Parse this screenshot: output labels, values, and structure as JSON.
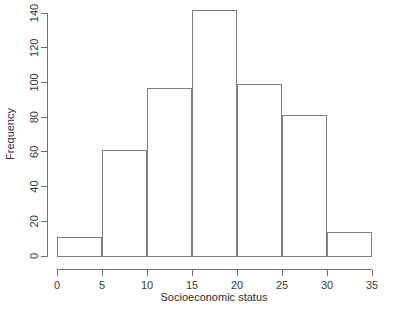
{
  "chart_data": {
    "type": "bar",
    "title": "",
    "subtitle": "",
    "xlabel": "Socioeconomic status",
    "ylabel": "Frequency",
    "xlim": [
      0,
      35
    ],
    "ylim": [
      0,
      145
    ],
    "grid": false,
    "legend": null,
    "bin_width": 5,
    "bin_edges": [
      0,
      5,
      10,
      15,
      20,
      25,
      30,
      35
    ],
    "categories": [
      "0-5",
      "5-10",
      "10-15",
      "15-20",
      "20-25",
      "25-30",
      "30-35"
    ],
    "values": [
      11,
      61,
      97,
      142,
      99,
      81,
      14
    ],
    "xticks": [
      0,
      5,
      10,
      15,
      20,
      25,
      30,
      35
    ],
    "xticklabels": [
      "0",
      "5",
      "10",
      "15",
      "20",
      "25",
      "30",
      "35"
    ],
    "yticks": [
      0,
      20,
      40,
      60,
      80,
      100,
      120,
      140
    ],
    "yticklabels": [
      "0",
      "20",
      "40",
      "60",
      "80",
      "100",
      "120",
      "140"
    ],
    "colors": {
      "bar_fill": "#ffffff",
      "bar_stroke": "#808080",
      "axis": "#707070",
      "text": "#2e2e2e",
      "background": "#ffffff"
    }
  }
}
